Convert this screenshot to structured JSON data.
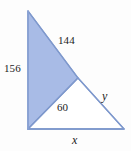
{
  "figure": {
    "background_color": "#fdfdfd",
    "shaded_fill_color": "#a8bbe6",
    "stroke_color": "#7f99cd",
    "label_color": "#1c1c1c",
    "labels": {
      "upper_hypotenuse": "144",
      "left_leg": "156",
      "shared_segment": "60",
      "lower_hypotenuse": "y",
      "base": "x"
    },
    "vertices": {
      "apex_top": {
        "x": 28,
        "y": 11
      },
      "bottom_left": {
        "x": 28,
        "y": 129
      },
      "middle": {
        "x": 78,
        "y": 78
      },
      "bottom_right": {
        "x": 124,
        "y": 129
      }
    },
    "shapes": {
      "shaded_triangle_points": "28,11 78,78 28,129",
      "white_triangle_points": "28,129 78,78 124,129",
      "outline_path": "M28,11 L78,78 L124,129 L28,129 Z",
      "shared_segment_path": "M28,129 L78,78"
    }
  }
}
